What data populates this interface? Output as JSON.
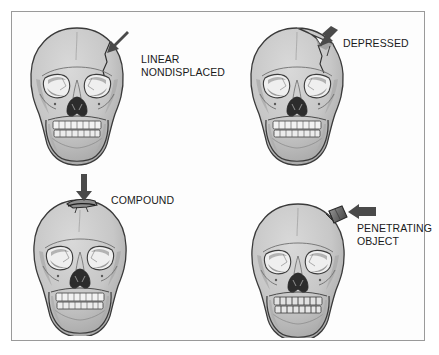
{
  "figure": {
    "background_color": "#ffffff",
    "border_color": "#9a9a9a",
    "label_color": "#1a1a1a",
    "skull_fill": "#c9c9c9",
    "skull_shade": "#a9a9a9",
    "skull_outline": "#3a3a3a",
    "arrow_color": "#4a4a4a",
    "object_fill": "#7a7a7a"
  },
  "panels": [
    {
      "id": "linear-nondisplaced",
      "label_line1": "LINEAR",
      "label_line2": "NONDISPLACED",
      "arrow_direction": "down-left",
      "fracture_type": "linear crack on right parietal"
    },
    {
      "id": "depressed",
      "label_line1": "DEPRESSED",
      "label_line2": "",
      "arrow_direction": "down",
      "fracture_type": "depressed segment of right frontal vault"
    },
    {
      "id": "compound",
      "label_line1": "COMPOUND",
      "label_line2": "",
      "arrow_direction": "down",
      "fracture_type": "open compound fracture at vertex"
    },
    {
      "id": "penetrating-object",
      "label_line1": "PENETRATING",
      "label_line2": "OBJECT",
      "arrow_direction": "left",
      "fracture_type": "foreign object embedded in right parietal"
    }
  ]
}
